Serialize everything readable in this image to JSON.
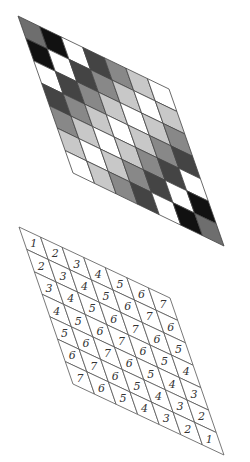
{
  "figure": {
    "grid_size": 7,
    "shaded_grid": {
      "origin": [
        18,
        16
      ],
      "col_vector": [
        21.57,
        10.43
      ],
      "row_vector": [
        7.86,
        22.43
      ],
      "stroke": "#444444"
    },
    "numbered_grid": {
      "origin": [
        19,
        227
      ],
      "col_vector": [
        21.57,
        10.14
      ],
      "row_vector": [
        7.71,
        22.43
      ],
      "stroke": "#555555"
    },
    "value_colors": {
      "1": "#6e6e6e",
      "2": "#111111",
      "3": "#ffffff",
      "4": "#444444",
      "5": "#888888",
      "6": "#c8c8c8",
      "7": "#ffffff"
    },
    "values": [
      [
        1,
        2,
        3,
        4,
        5,
        6,
        7
      ],
      [
        2,
        3,
        4,
        5,
        6,
        7,
        6
      ],
      [
        3,
        4,
        5,
        6,
        7,
        6,
        5
      ],
      [
        4,
        5,
        6,
        7,
        6,
        5,
        4
      ],
      [
        5,
        6,
        7,
        6,
        5,
        4,
        3
      ],
      [
        6,
        7,
        6,
        5,
        4,
        3,
        2
      ],
      [
        7,
        6,
        5,
        4,
        3,
        2,
        1
      ]
    ]
  }
}
